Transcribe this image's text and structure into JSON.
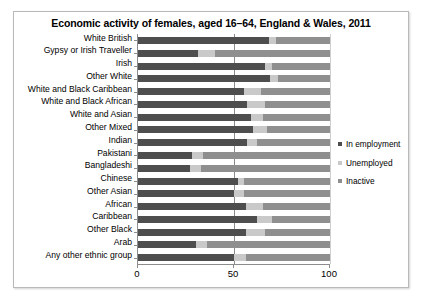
{
  "chart_data": {
    "type": "bar",
    "orientation": "horizontal",
    "stacked": true,
    "title": "Economic activity of females, aged 16–64, England & Wales, 2011",
    "xlabel": "",
    "ylabel": "",
    "xlim": [
      0,
      100
    ],
    "xticks": [
      "0",
      "50",
      "100"
    ],
    "xtick_values": [
      0,
      50,
      100
    ],
    "grid": true,
    "legend_position": "right",
    "categories": [
      "White British",
      "Gypsy or Irish Traveller",
      "Irish",
      "Other White",
      "White and Black Caribbean",
      "White and Black African",
      "White and Asian",
      "Other Mixed",
      "Indian",
      "Pakistani",
      "Bangladeshi",
      "Chinese",
      "Other Asian",
      "African",
      "Caribbean",
      "Other Black",
      "Arab",
      "Any other ethnic group"
    ],
    "series": [
      {
        "name": "In employment",
        "color": "#4e4e4e",
        "values": [
          68,
          31,
          66,
          69,
          55,
          57,
          59,
          60,
          57,
          28,
          27,
          52,
          50,
          56,
          62,
          56,
          30,
          50
        ]
      },
      {
        "name": "Unemployed",
        "color": "#c9c9c9",
        "values": [
          4,
          9,
          4,
          4,
          9,
          9,
          6,
          7,
          5,
          6,
          6,
          3,
          5,
          9,
          8,
          10,
          6,
          6
        ]
      },
      {
        "name": "Inactive",
        "color": "#8f8f8f",
        "values": [
          28,
          60,
          30,
          27,
          36,
          34,
          35,
          33,
          38,
          66,
          67,
          45,
          45,
          35,
          30,
          34,
          64,
          44
        ]
      }
    ]
  },
  "legend": {
    "items": [
      {
        "label": "In employment",
        "color": "#4e4e4e"
      },
      {
        "label": "Unemployed",
        "color": "#c9c9c9"
      },
      {
        "label": "Inactive",
        "color": "#8f8f8f"
      }
    ]
  }
}
